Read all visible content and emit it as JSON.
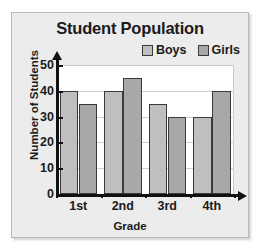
{
  "figure": {
    "title": "Student Population",
    "xlabel": "Grade",
    "ylabel": "Number of Students"
  },
  "legend": {
    "items": [
      {
        "label": "Boys",
        "color": "#bfbfbf"
      },
      {
        "label": "Girls",
        "color": "#a8a8a8"
      }
    ]
  },
  "axes": {
    "yticks": [
      "0",
      "10",
      "20",
      "30",
      "40",
      "50"
    ],
    "xticks": [
      "1st",
      "2nd",
      "3rd",
      "4th"
    ]
  },
  "chart_data": {
    "type": "bar",
    "title": "Student Population",
    "xlabel": "Grade",
    "ylabel": "Number of Students",
    "categories": [
      "1st",
      "2nd",
      "3rd",
      "4th"
    ],
    "series": [
      {
        "name": "Boys",
        "color": "#bfbfbf",
        "values": [
          40,
          40,
          35,
          30
        ]
      },
      {
        "name": "Girls",
        "color": "#a8a8a8",
        "values": [
          35,
          45,
          30,
          40
        ]
      }
    ],
    "ylim": [
      0,
      50
    ],
    "ytick_step": 10,
    "grid": true,
    "legend_position": "top-right"
  }
}
